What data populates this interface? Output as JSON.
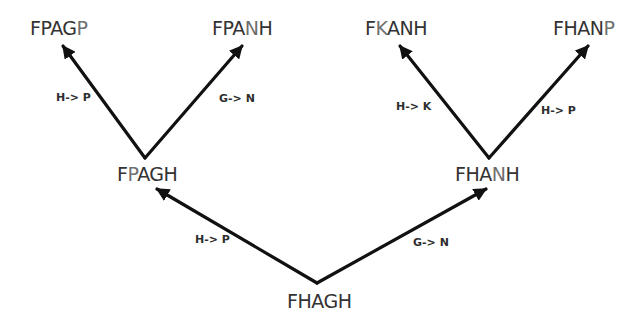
{
  "diagram": {
    "type": "mutation-tree",
    "colors": {
      "text": "#333333",
      "changed_letter": "#6f6f6f",
      "arrow": "#111111",
      "background": "#ffffff"
    },
    "nodes": [
      {
        "id": "root",
        "label": "FHAGH",
        "chars": [
          "F",
          "H",
          "A",
          "G",
          "H"
        ],
        "changed_index": -1,
        "x": 287,
        "y": 290
      },
      {
        "id": "left",
        "label": "FPAGH",
        "chars": [
          "F",
          "P",
          "A",
          "G",
          "H"
        ],
        "changed_index": 1,
        "x": 117,
        "y": 163
      },
      {
        "id": "right",
        "label": "FHANH",
        "chars": [
          "F",
          "H",
          "A",
          "N",
          "H"
        ],
        "changed_index": 3,
        "x": 455,
        "y": 163
      },
      {
        "id": "ll",
        "label": "FPAGP",
        "chars": [
          "F",
          "P",
          "A",
          "G",
          "P"
        ],
        "changed_index": 4,
        "x": 30,
        "y": 17
      },
      {
        "id": "lr",
        "label": "FPANH",
        "chars": [
          "F",
          "P",
          "A",
          "N",
          "H"
        ],
        "changed_index": 3,
        "x": 212,
        "y": 17
      },
      {
        "id": "rl",
        "label": "FKANH",
        "chars": [
          "F",
          "K",
          "A",
          "N",
          "H"
        ],
        "changed_index": 1,
        "x": 365,
        "y": 17
      },
      {
        "id": "rr",
        "label": "FHANP",
        "chars": [
          "F",
          "H",
          "A",
          "N",
          "P"
        ],
        "changed_index": 4,
        "x": 553,
        "y": 17
      }
    ],
    "edges": [
      {
        "from": "root",
        "to": "left",
        "label": "H-> P",
        "x1": 317,
        "y1": 283,
        "x2": 157,
        "y2": 189,
        "lx": 195,
        "ly": 233
      },
      {
        "from": "root",
        "to": "right",
        "label": "G-> N",
        "x1": 317,
        "y1": 283,
        "x2": 486,
        "y2": 189,
        "lx": 413,
        "ly": 236
      },
      {
        "from": "left",
        "to": "ll",
        "label": "H-> P",
        "x1": 145,
        "y1": 158,
        "x2": 63,
        "y2": 46,
        "lx": 56,
        "ly": 91
      },
      {
        "from": "left",
        "to": "lr",
        "label": "G-> N",
        "x1": 145,
        "y1": 158,
        "x2": 242,
        "y2": 46,
        "lx": 219,
        "ly": 92
      },
      {
        "from": "right",
        "to": "rl",
        "label": "H-> K",
        "x1": 489,
        "y1": 158,
        "x2": 400,
        "y2": 46,
        "lx": 396,
        "ly": 100
      },
      {
        "from": "right",
        "to": "rr",
        "label": "H-> P",
        "x1": 489,
        "y1": 158,
        "x2": 588,
        "y2": 46,
        "lx": 541,
        "ly": 104
      }
    ]
  }
}
